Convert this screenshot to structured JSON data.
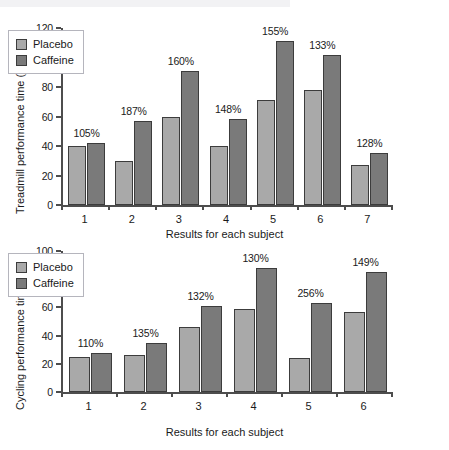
{
  "figure": {
    "background": "#ffffff",
    "placebo_color": "#a9a9a9",
    "caffeine_color": "#7a7a7a"
  },
  "legend": {
    "placebo_label": "Placebo",
    "caffeine_label": "Caffeine"
  },
  "chart_data": [
    {
      "type": "bar",
      "id": "treadmill",
      "title": "",
      "xlabel": "Results for each subject",
      "ylabel": "Treadmill performance time (min)",
      "ylim": [
        0,
        120
      ],
      "yticks": [
        0,
        20,
        40,
        60,
        80,
        100,
        120
      ],
      "ytick_labels": [
        "0",
        "20",
        "40",
        "60",
        "80",
        "100",
        "120"
      ],
      "categories": [
        "1",
        "2",
        "3",
        "4",
        "5",
        "6",
        "7"
      ],
      "grid": false,
      "legend_position": "upper-left",
      "series": [
        {
          "name": "Placebo",
          "values": [
            40,
            30,
            60,
            40,
            71,
            78,
            27
          ]
        },
        {
          "name": "Caffeine",
          "values": [
            42,
            57,
            91,
            58,
            111,
            102,
            35
          ]
        }
      ],
      "annotations": [
        "105%",
        "187%",
        "160%",
        "148%",
        "155%",
        "133%",
        "128%"
      ]
    },
    {
      "type": "bar",
      "id": "cycling",
      "title": "",
      "xlabel": "Results for each subject",
      "ylabel": "Cycling performance time (min)",
      "ylim": [
        0,
        100
      ],
      "yticks": [
        0,
        20,
        40,
        60,
        80,
        100
      ],
      "ytick_labels": [
        "0",
        "20",
        "40",
        "60",
        "80",
        "100"
      ],
      "categories": [
        "1",
        "2",
        "3",
        "4",
        "5",
        "6"
      ],
      "grid": false,
      "legend_position": "upper-left",
      "series": [
        {
          "name": "Placebo",
          "values": [
            25,
            26,
            46,
            59,
            24,
            57
          ]
        },
        {
          "name": "Caffeine",
          "values": [
            28,
            35,
            61,
            88,
            63,
            85
          ]
        }
      ],
      "annotations": [
        "110%",
        "135%",
        "132%",
        "130%",
        "256%",
        "149%"
      ]
    }
  ]
}
